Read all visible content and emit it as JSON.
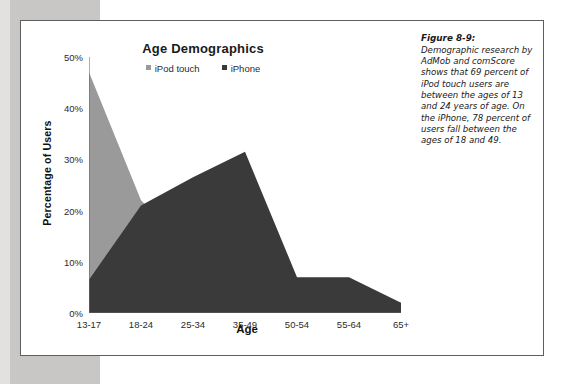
{
  "figure": {
    "caption_label": "Figure 8-9:",
    "caption_body": "Demographic research by AdMob and comScore shows that 69 percent of iPod touch users are between the ages of 13 and 24 years of age. On the iPhone, 78 percent of users fall between the ages of 18 and 49."
  },
  "colors": {
    "ipod_touch": "#9a9a9a",
    "iphone": "#3a3a3a",
    "axis": "#6b6b6b",
    "text": "#2b2b2b",
    "page_margin": "#c8c7c5"
  },
  "chart_data": {
    "type": "area",
    "title": "Age Demographics",
    "xlabel": "Age",
    "ylabel": "Percentage of Users",
    "categories": [
      "13-17",
      "18-24",
      "25-34",
      "35-49",
      "50-54",
      "55-64",
      "65+"
    ],
    "ylim": [
      0,
      50
    ],
    "yticks": [
      0,
      10,
      20,
      30,
      40,
      50
    ],
    "ytick_labels": [
      "0%",
      "10%",
      "20%",
      "30%",
      "40%",
      "50%"
    ],
    "grid": false,
    "legend_position": "top-center",
    "series": [
      {
        "name": "iPod touch",
        "color": "#9a9a9a",
        "values": [
          47,
          22,
          12,
          11.5,
          5,
          3,
          2
        ]
      },
      {
        "name": "iPhone",
        "color": "#3a3a3a",
        "values": [
          6.5,
          21,
          26.5,
          31.5,
          7,
          7,
          2
        ]
      }
    ]
  }
}
